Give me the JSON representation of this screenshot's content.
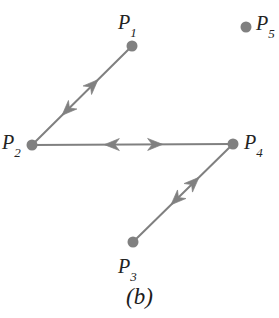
{
  "figure": {
    "caption": "(b)",
    "caption_x": 0,
    "caption_y": 285,
    "width": 279,
    "height": 318,
    "background": "#ffffff",
    "graphic_color": "#808080",
    "label_color": "#232323",
    "node_radius": 5.5,
    "edge_width": 2.0
  },
  "nodes": [
    {
      "id": "P1",
      "label_base": "P",
      "label_sub": "1",
      "cx": 132,
      "cy": 46,
      "label_x": 118,
      "label_y": 12,
      "color": "#808080"
    },
    {
      "id": "P2",
      "label_base": "P",
      "label_sub": "2",
      "cx": 32,
      "cy": 145,
      "label_x": 2,
      "label_y": 132,
      "color": "#808080"
    },
    {
      "id": "P3",
      "label_base": "P",
      "label_sub": "3",
      "cx": 133,
      "cy": 242,
      "label_x": 118,
      "label_y": 256,
      "color": "#808080"
    },
    {
      "id": "P4",
      "label_base": "P",
      "label_sub": "4",
      "cx": 233,
      "cy": 144,
      "label_x": 244,
      "label_y": 132,
      "color": "#808080"
    },
    {
      "id": "P5",
      "label_base": "P",
      "label_sub": "5",
      "cx": 246,
      "cy": 27,
      "label_x": 256,
      "label_y": 13,
      "color": "#808080"
    }
  ],
  "edges": [
    {
      "id": "edge-P2-P1",
      "from": "P2",
      "to": "P1",
      "x1": 32,
      "y1": 145,
      "x2": 132,
      "y2": 46,
      "bidirectional": true,
      "arrow_forward_t": 0.66,
      "arrow_backward_t": 0.3
    },
    {
      "id": "edge-P2-P4",
      "from": "P2",
      "to": "P4",
      "x1": 32,
      "y1": 145,
      "x2": 233,
      "y2": 144,
      "bidirectional": true,
      "arrow_forward_t": 0.65,
      "arrow_backward_t": 0.36
    },
    {
      "id": "edge-P3-P4",
      "from": "P3",
      "to": "P4",
      "x1": 133,
      "y1": 242,
      "x2": 233,
      "y2": 144,
      "bidirectional": true,
      "arrow_forward_t": 0.66,
      "arrow_backward_t": 0.38
    }
  ],
  "isolated_nodes": [
    "P5"
  ]
}
